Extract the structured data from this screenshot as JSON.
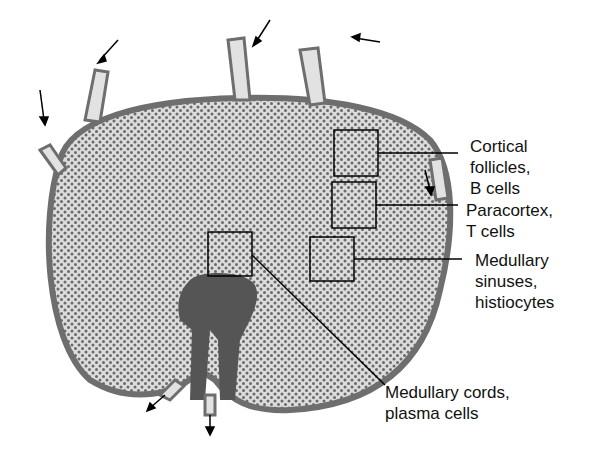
{
  "diagram": {
    "colors": {
      "capsule": "#6e6e6e",
      "tissue": "#d8d8d8",
      "dots": "#707070",
      "medulla": "#555555",
      "lines": "#000000"
    },
    "labels": [
      {
        "id": "cortical",
        "lines": [
          "Cortical",
          "follicles,",
          "B cells"
        ]
      },
      {
        "id": "paracortex",
        "lines": [
          "Paracortex,",
          "T cells"
        ]
      },
      {
        "id": "sinuses",
        "lines": [
          "Medullary",
          "sinuses,",
          "histiocytes"
        ]
      },
      {
        "id": "cords",
        "lines": [
          "Medullary cords,",
          "plasma cells"
        ]
      }
    ]
  }
}
